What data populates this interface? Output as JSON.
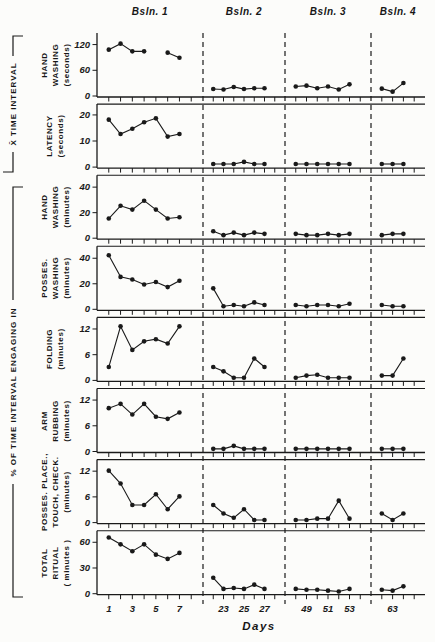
{
  "figure": {
    "left_labels": [
      "X̄ TIME INTERVAL",
      "% OF TIME INTERVAL ENGAGING IN"
    ]
  },
  "chart_data": {
    "type": "line",
    "xlabel": "Days",
    "marker": "filled-circle",
    "ink_color": "#1a1a1a",
    "background": "#fcfcfa",
    "phases": [
      {
        "label": "Bsln. 1",
        "tick_days": [
          1,
          2,
          3,
          4,
          5,
          6,
          7,
          8
        ],
        "labeled_days": [
          1,
          3,
          5,
          7
        ]
      },
      {
        "label": "Bsln. 2",
        "tick_days": [
          22,
          23,
          24,
          25,
          26,
          27,
          28
        ],
        "labeled_days": [
          23,
          25,
          27
        ]
      },
      {
        "label": "Bsln. 3",
        "tick_days": [
          48,
          49,
          50,
          51,
          52,
          53,
          54
        ],
        "labeled_days": [
          49,
          51,
          53
        ]
      },
      {
        "label": "Bsln. 4",
        "tick_days": [
          62,
          63,
          64,
          65
        ],
        "labeled_days": [
          63
        ]
      }
    ],
    "panels": [
      {
        "name": "hand-washing-seconds",
        "label_lines": [
          "HAND",
          "WASHING",
          "(seconds)"
        ],
        "yticks": [
          0,
          60,
          120
        ],
        "ymax": 140,
        "values": [
          [
            107,
            121,
            103,
            103,
            null,
            100,
            88
          ],
          [
            15,
            14,
            20,
            15,
            17,
            17
          ],
          [
            21,
            23,
            17,
            21,
            14,
            26
          ],
          [
            16,
            9,
            29
          ]
        ]
      },
      {
        "name": "latency-seconds",
        "label_lines": [
          "LATENCY",
          "(seconds)"
        ],
        "yticks": [
          0,
          10,
          20
        ],
        "ymax": 23,
        "values": [
          [
            18,
            12.5,
            14.5,
            17,
            18.5,
            11.5,
            12.5
          ],
          [
            1,
            1,
            1,
            1.8,
            1,
            1
          ],
          [
            1,
            1,
            1,
            1,
            1,
            1
          ],
          [
            1,
            1,
            1
          ]
        ]
      },
      {
        "name": "hand-washing-minutes",
        "label_lines": [
          "HAND",
          "WASHING",
          "(minutes)"
        ],
        "yticks": [
          0,
          20,
          40
        ],
        "ymax": 47,
        "values": [
          [
            15,
            25,
            22,
            29,
            22,
            15,
            16
          ],
          [
            5,
            2,
            4,
            2,
            4,
            3
          ],
          [
            3,
            2,
            2,
            3,
            2,
            3
          ],
          [
            2,
            3,
            3
          ]
        ]
      },
      {
        "name": "posses-washing-minutes",
        "label_lines": [
          "POSSES.",
          "WASHING",
          "(minutes)"
        ],
        "yticks": [
          0,
          20,
          40
        ],
        "ymax": 47,
        "values": [
          [
            42,
            25,
            23,
            19,
            21,
            17,
            22
          ],
          [
            16,
            2,
            3,
            2,
            5,
            3
          ],
          [
            3,
            2,
            3,
            3,
            2,
            4
          ],
          [
            3,
            2,
            2
          ]
        ]
      },
      {
        "name": "folding-minutes",
        "label_lines": [
          "FOLDING",
          "(minutes)"
        ],
        "yticks": [
          0,
          6,
          12
        ],
        "ymax": 14,
        "values": [
          [
            3,
            12.5,
            7,
            9,
            9.5,
            8.5,
            12.5
          ],
          [
            3,
            2,
            0.5,
            0.5,
            5,
            3
          ],
          [
            0.5,
            1,
            1.2,
            0.5,
            0.5,
            0.5
          ],
          [
            1,
            1,
            5
          ]
        ]
      },
      {
        "name": "arm-rubbing-minutes",
        "label_lines": [
          "ARM",
          "RUBBING",
          "(minutes)"
        ],
        "yticks": [
          0,
          6,
          12
        ],
        "ymax": 14,
        "values": [
          [
            10,
            11,
            8.5,
            11,
            8,
            7.5,
            9
          ],
          [
            0.5,
            0.5,
            1.2,
            0.5,
            0.5,
            0.5
          ],
          [
            0.5,
            0.5,
            0.5,
            0.5,
            0.5,
            0.5
          ],
          [
            0.5,
            0.5,
            0.5
          ]
        ]
      },
      {
        "name": "posses-place-touch-check-minutes",
        "label_lines": [
          "POSSES. PLACE.,",
          "TOUCH, CHECK.",
          "(minutes)"
        ],
        "yticks": [
          0,
          6,
          12
        ],
        "ymax": 14,
        "values": [
          [
            12,
            9,
            4,
            4,
            6.5,
            3,
            6
          ],
          [
            4,
            2,
            1,
            3,
            0.5,
            0.5
          ],
          [
            0.5,
            0.5,
            0.8,
            0.8,
            5,
            0.8
          ],
          [
            2,
            0.5,
            2
          ]
        ]
      },
      {
        "name": "total-ritual-minutes",
        "label_lines": [
          "TOTAL",
          "RITUAL",
          "( minutes )"
        ],
        "yticks": [
          0,
          30,
          60
        ],
        "ymax": 70,
        "values": [
          [
            65,
            57,
            49,
            57,
            45,
            40,
            47
          ],
          [
            18,
            5,
            6,
            5,
            10,
            5
          ],
          [
            5,
            4,
            4,
            3,
            2,
            5
          ],
          [
            4,
            3,
            8
          ]
        ]
      }
    ]
  }
}
